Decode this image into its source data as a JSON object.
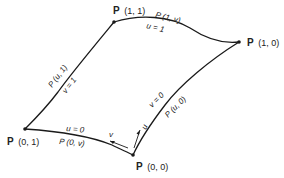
{
  "diagram": {
    "type": "parametric-surface-patch",
    "corners": [
      {
        "id": "p11",
        "bold": "P",
        "args": "(1, 1)",
        "x": 114,
        "y": 22
      },
      {
        "id": "p10",
        "bold": "P",
        "args": "(1, 0)",
        "x": 239,
        "y": 42
      },
      {
        "id": "p01",
        "bold": "P",
        "args": "(0, 1)",
        "x": 25,
        "y": 129
      },
      {
        "id": "p00",
        "bold": "P",
        "args": "(0, 0)",
        "x": 133,
        "y": 155
      }
    ],
    "edges": {
      "top": {
        "curve_label": "P (1, v)",
        "param_label": "u = 1"
      },
      "left": {
        "curve_label": "P (u, 1)",
        "param_label": "v = 1"
      },
      "bottom": {
        "curve_label": "P (0, v)",
        "param_label": "u = 0"
      },
      "right": {
        "curve_label": "P (u, 0)",
        "param_label": "v = 0"
      }
    },
    "direction_arrows": {
      "v": "v",
      "u": "u"
    },
    "line_color": "#1a1a1a",
    "background": "#ffffff"
  }
}
